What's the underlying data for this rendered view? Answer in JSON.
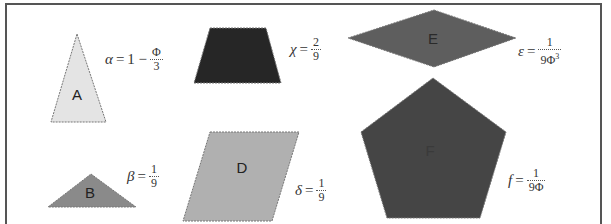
{
  "shapes": [
    {
      "id": "A",
      "label": "A",
      "kind": "isosceles-triangle",
      "fill": "#e4e4e4",
      "points": "77,34 106,122 51,122",
      "label_pos": [
        77,
        100
      ],
      "label_color": "#222222"
    },
    {
      "id": "B",
      "label": "B",
      "kind": "obtuse-triangle",
      "fill": "#8a8a8a",
      "points": "91,174 136,207 48,207",
      "label_pos": [
        90,
        198
      ],
      "label_color": "#222222"
    },
    {
      "id": "C",
      "label": "",
      "kind": "trapezoid",
      "fill": "#262626",
      "points": "210,28 266,28 281,83 194,83",
      "label_pos": [
        238,
        60
      ],
      "label_color": "#262626"
    },
    {
      "id": "D",
      "label": "D",
      "kind": "parallelogram",
      "fill": "#b0b0b0",
      "points": "210,132 299,132 272,221 183,221",
      "label_pos": [
        242,
        173
      ],
      "label_color": "#222222"
    },
    {
      "id": "E",
      "label": "E",
      "kind": "rhombus",
      "fill": "#5e5e5e",
      "points": "434,10 516,38 434,67 348,38",
      "label_pos": [
        433,
        44
      ],
      "label_color": "#2a2a2a"
    },
    {
      "id": "F",
      "label": "F",
      "kind": "pentagon",
      "fill": "#454545",
      "points": "433,78 506,132 480,218 387,218 361,132",
      "label_pos": [
        430,
        156
      ],
      "label_color": "#3a3a3a"
    }
  ],
  "formulas": [
    {
      "id": "alpha",
      "var": "α",
      "eq": "=",
      "prefix": "1 −",
      "num": "Φ",
      "den": "3",
      "sup": "",
      "pos": [
        105,
        46
      ]
    },
    {
      "id": "beta",
      "var": "β",
      "eq": "=",
      "prefix": "",
      "num": "1",
      "den": "9",
      "sup": "",
      "pos": [
        127,
        163
      ]
    },
    {
      "id": "chi",
      "var": "χ",
      "eq": "=",
      "prefix": "",
      "num": "2",
      "den": "9",
      "sup": "",
      "pos": [
        290,
        36
      ]
    },
    {
      "id": "delta",
      "var": "δ",
      "eq": "=",
      "prefix": "",
      "num": "1",
      "den": "9",
      "sup": "",
      "pos": [
        295,
        177
      ]
    },
    {
      "id": "epsilon",
      "var": "ε",
      "eq": "=",
      "prefix": "",
      "num": "1",
      "den": "9Φ",
      "sup": "3",
      "pos": [
        518,
        36
      ]
    },
    {
      "id": "f",
      "var": "f",
      "eq": "=",
      "prefix": "",
      "num": "1",
      "den": "9Φ",
      "sup": "",
      "pos": [
        508,
        167
      ]
    }
  ]
}
